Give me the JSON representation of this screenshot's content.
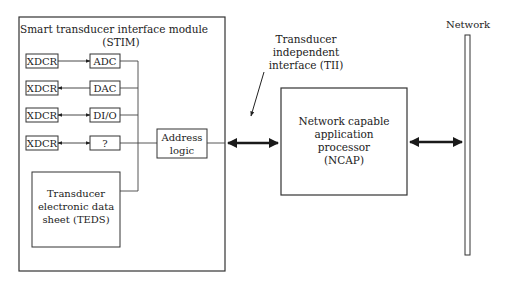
{
  "stim": {
    "title_line1": "Smart transducer interface module",
    "title_line2": "(STIM)",
    "rows": [
      {
        "xdcr": "XDCR",
        "block": "ADC",
        "direction": "xdcr-to-block"
      },
      {
        "xdcr": "XDCR",
        "block": "DAC",
        "direction": "block-to-xdcr"
      },
      {
        "xdcr": "XDCR",
        "block": "DI/O",
        "direction": "bidirectional"
      },
      {
        "xdcr": "XDCR",
        "block": "?",
        "direction": "bidirectional"
      }
    ],
    "address_logic": [
      "Address",
      "logic"
    ],
    "teds": [
      "Transducer",
      "electronic data",
      "sheet (TEDS)"
    ]
  },
  "tii": {
    "label": [
      "Transducer",
      "independent",
      "interface (TII)"
    ]
  },
  "ncap": {
    "label": [
      "Network capable",
      "application",
      "processor",
      "(NCAP)"
    ]
  },
  "network": {
    "label": "Network"
  },
  "colors": {
    "line": "#333333",
    "arrow": "#1a1a1a"
  }
}
